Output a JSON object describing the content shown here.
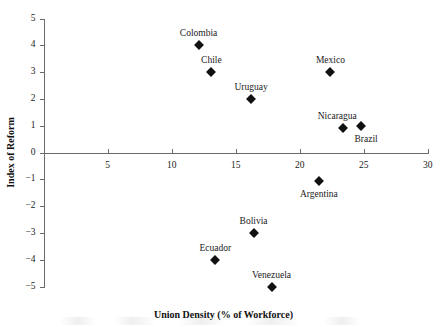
{
  "chart_data": {
    "type": "scatter",
    "title": "",
    "xlabel": "Union Density (% of Workforce)",
    "ylabel": "Index of Reform",
    "xlim": [
      0,
      30
    ],
    "ylim": [
      -5,
      5
    ],
    "xticks": [
      5,
      10,
      15,
      20,
      25,
      30
    ],
    "xtick_labels": [
      "5",
      "10",
      "15",
      "20",
      "25",
      "30"
    ],
    "yticks": [
      5,
      4,
      3,
      2,
      1,
      0,
      -1,
      -2,
      -3,
      -4,
      -5
    ],
    "ytick_labels": [
      "5",
      "4",
      "3",
      "2",
      "1",
      "0",
      "−1",
      "−2",
      "−3",
      "−4",
      "−5"
    ],
    "grid": false,
    "legend": false,
    "marker": "diamond",
    "marker_color": "#111111",
    "axis_color": "#6b6b6b",
    "points": [
      {
        "label": "Colombia",
        "x": 12.1,
        "y": 4.0,
        "label_pos": "above"
      },
      {
        "label": "Chile",
        "x": 13.1,
        "y": 3.0,
        "label_pos": "above"
      },
      {
        "label": "Uruguay",
        "x": 16.2,
        "y": 2.0,
        "label_pos": "above"
      },
      {
        "label": "Mexico",
        "x": 22.4,
        "y": 3.0,
        "label_pos": "above"
      },
      {
        "label": "Nicaragua",
        "x": 23.4,
        "y": 0.9,
        "label_pos": "above-left"
      },
      {
        "label": "Brazil",
        "x": 24.8,
        "y": 1.0,
        "label_pos": "below-right"
      },
      {
        "label": "Argentina",
        "x": 21.5,
        "y": -1.05,
        "label_pos": "below"
      },
      {
        "label": "Bolivia",
        "x": 16.4,
        "y": -3.0,
        "label_pos": "above"
      },
      {
        "label": "Ecuador",
        "x": 13.4,
        "y": -4.0,
        "label_pos": "above"
      },
      {
        "label": "Venezuela",
        "x": 17.8,
        "y": -5.0,
        "label_pos": "above"
      }
    ]
  }
}
